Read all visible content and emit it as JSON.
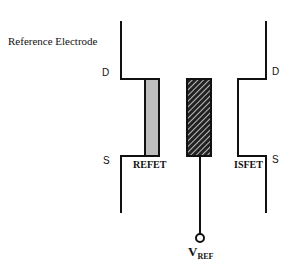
{
  "diagram": {
    "reference_electrode_label": "Reference Electrode",
    "left_transistor": {
      "name": "REFET",
      "drain_label": "D",
      "source_label": "S",
      "gate_fill": "#bdbdbd"
    },
    "right_transistor": {
      "name": "ISFET",
      "drain_label": "D",
      "source_label": "S"
    },
    "reference_electrode": {
      "fill": "hatched",
      "terminal_main": "V",
      "terminal_sub": "REF"
    },
    "colors": {
      "stroke": "#111111",
      "background": "#ffffff"
    }
  }
}
